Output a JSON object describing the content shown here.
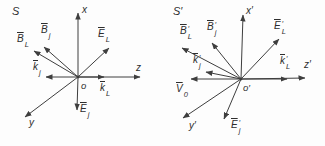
{
  "figure": {
    "colors": {
      "background": "#fdfdfd",
      "line": "#3e3e3e",
      "text": "#2e2e2e"
    },
    "left": {
      "frame": "S",
      "origin": "o",
      "axis": {
        "x": "x",
        "z": "z",
        "y": "y"
      },
      "vec": {
        "BL": {
          "base": "B",
          "prime": "",
          "sub": "L"
        },
        "Bj": {
          "base": "B",
          "prime": "",
          "sub": "j"
        },
        "EL": {
          "base": "E",
          "prime": "",
          "sub": "L"
        },
        "Ej": {
          "base": "E",
          "prime": "",
          "sub": "j"
        },
        "kj": {
          "base": "k",
          "prime": "",
          "sub": "j"
        },
        "kL": {
          "base": "k",
          "prime": "",
          "sub": "L"
        }
      }
    },
    "right": {
      "frame": "S′",
      "origin": "o′",
      "axis": {
        "x": "x′",
        "z": "z′",
        "y": "y′"
      },
      "vec": {
        "BL": {
          "base": "B",
          "prime": "′",
          "sub": "L"
        },
        "Bj": {
          "base": "B",
          "prime": "′",
          "sub": "j"
        },
        "EL": {
          "base": "E",
          "prime": "′",
          "sub": "L"
        },
        "Ej": {
          "base": "E",
          "prime": "′",
          "sub": "j"
        },
        "kj": {
          "base": "k",
          "prime": "′",
          "sub": "j"
        },
        "kL": {
          "base": "k",
          "prime": "′",
          "sub": "L"
        },
        "V0": {
          "base": "V",
          "prime": "",
          "sub": "0"
        }
      }
    }
  }
}
